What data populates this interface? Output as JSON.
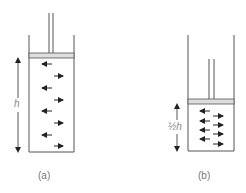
{
  "diagram": {
    "panels": [
      {
        "id": "a",
        "caption": "(a)",
        "height_label": "h",
        "molecule_arrows": [
          "left",
          "right",
          "left",
          "right",
          "left",
          "right",
          "left",
          "right"
        ]
      },
      {
        "id": "b",
        "caption": "(b)",
        "height_label": "½h",
        "molecule_arrows": [
          "left",
          "right",
          "left",
          "right",
          "left",
          "right",
          "left",
          "right"
        ]
      }
    ],
    "colors": {
      "line": "#555555",
      "arrow": "#222222",
      "piston_fill": "#dddddd",
      "label": "#777777"
    }
  }
}
